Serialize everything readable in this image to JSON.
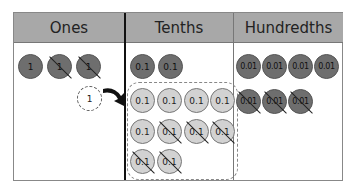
{
  "columns": [
    {
      "label": "Ones"
    },
    {
      "label": "Tenths"
    },
    {
      "label": "Hundredths"
    }
  ],
  "ones": {
    "circles": [
      {
        "value": "1",
        "crossed": false
      },
      {
        "value": "1",
        "crossed": true
      },
      {
        "value": "1",
        "crossed": true
      }
    ],
    "regrouped_circle": {
      "value": "1",
      "style": "dashed"
    }
  },
  "tenths": {
    "top_circles": [
      {
        "value": "0.1",
        "crossed": false
      },
      {
        "value": "0.1",
        "crossed": false
      }
    ],
    "regrouped_circles": [
      {
        "value": "0.1",
        "crossed": false
      },
      {
        "value": "0.1",
        "crossed": false
      },
      {
        "value": "0.1",
        "crossed": false
      },
      {
        "value": "0.1",
        "crossed": false
      },
      {
        "value": "0.1",
        "crossed": false
      },
      {
        "value": "0.1",
        "crossed": true
      },
      {
        "value": "0.1",
        "crossed": true
      },
      {
        "value": "0.1",
        "crossed": true
      },
      {
        "value": "0.1",
        "crossed": true
      },
      {
        "value": "0.1",
        "crossed": true
      }
    ]
  },
  "hundredths": {
    "circles": [
      {
        "value": "0.01",
        "crossed": false
      },
      {
        "value": "0.01",
        "crossed": false
      },
      {
        "value": "0.01",
        "crossed": false
      },
      {
        "value": "0.01",
        "crossed": false
      },
      {
        "value": "0.01",
        "crossed": true
      },
      {
        "value": "0.01",
        "crossed": true
      },
      {
        "value": "0.01",
        "crossed": true
      }
    ]
  },
  "colors": {
    "header_bg": "#a8a8a8",
    "dark_counter": "#6e6e6e",
    "light_counter": "#d2d2d2"
  }
}
